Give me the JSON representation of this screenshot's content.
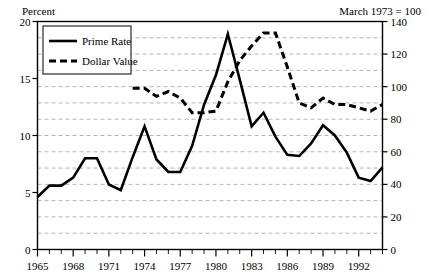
{
  "chart_data": {
    "type": "line",
    "title": "",
    "header_left": "Percent",
    "header_right": "March 1973 = 100",
    "xlabel": "",
    "ylabel_left": "Percent",
    "ylabel_right": "March 1973 = 100",
    "xlim": [
      1965,
      1994
    ],
    "x_tick_labels": [
      "1965",
      "1968",
      "1971",
      "1974",
      "1977",
      "1980",
      "1983",
      "1986",
      "1989",
      "1992"
    ],
    "x_tick_values": [
      1965,
      1968,
      1971,
      1974,
      1977,
      1980,
      1983,
      1986,
      1989,
      1992
    ],
    "x_minor_step": 1,
    "ylim_left": [
      0,
      20
    ],
    "y_left_tick_labels": [
      "0",
      "5",
      "10",
      "15",
      "20"
    ],
    "y_left_tick_values": [
      0,
      5,
      10,
      15,
      20
    ],
    "ylim_right": [
      0,
      140
    ],
    "y_right_tick_labels": [
      "0",
      "20",
      "40",
      "60",
      "80",
      "100",
      "120",
      "140"
    ],
    "y_right_tick_values": [
      0,
      20,
      40,
      60,
      80,
      100,
      120,
      140
    ],
    "grid": true,
    "grid_style": "dashed-horizontal",
    "grid_step_right": 10,
    "legend_position": "top-left",
    "legend_entries": [
      "Prime Rate",
      "Dollar Value"
    ],
    "colors": {
      "prime_rate": "#000000",
      "dollar_value": "#000000",
      "grid": "#b4b4b4",
      "axis": "#000000"
    },
    "series": [
      {
        "name": "Prime Rate",
        "axis": "left",
        "style": "solid",
        "x": [
          1965,
          1966,
          1967,
          1968,
          1969,
          1970,
          1971,
          1972,
          1973,
          1974,
          1975,
          1976,
          1977,
          1978,
          1979,
          1980,
          1981,
          1982,
          1983,
          1984,
          1985,
          1986,
          1987,
          1988,
          1989,
          1990,
          1991,
          1992,
          1993,
          1994
        ],
        "values": [
          4.6,
          5.6,
          5.6,
          6.3,
          8.0,
          8.0,
          5.7,
          5.2,
          8.1,
          10.8,
          7.9,
          6.8,
          6.8,
          9.1,
          12.7,
          15.3,
          18.9,
          14.9,
          10.8,
          12.0,
          9.9,
          8.3,
          8.2,
          9.3,
          10.9,
          10.0,
          8.5,
          6.3,
          6.0,
          7.2
        ]
      },
      {
        "name": "Dollar Value",
        "axis": "right",
        "style": "dashed",
        "x": [
          1973,
          1974,
          1975,
          1976,
          1977,
          1978,
          1979,
          1980,
          1981,
          1982,
          1983,
          1984,
          1985,
          1986,
          1987,
          1988,
          1989,
          1990,
          1991,
          1992,
          1993,
          1994
        ],
        "values": [
          99,
          99,
          94,
          97,
          93,
          84,
          84,
          85,
          103,
          116,
          125,
          133,
          133,
          112,
          90,
          87,
          93,
          89,
          89,
          87,
          85,
          89
        ]
      }
    ]
  }
}
